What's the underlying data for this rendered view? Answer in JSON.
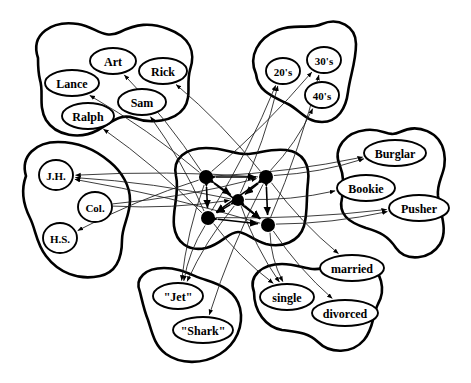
{
  "figure": {
    "type": "semantic-network-diagram",
    "width": 471,
    "height": 383,
    "background_color": "#ffffff",
    "outline_color": "#000000",
    "link_color": "#1a1a1a",
    "instance_node_color": "#000000"
  },
  "clusters": [
    {
      "id": "names",
      "name": "name-cluster",
      "outline": "M 38,58 C 30,34 52,20 78,24 C 96,27 104,40 120,32 C 136,24 150,22 168,29 C 190,37 196,52 190,70 C 186,84 192,96 184,108 C 174,122 150,124 134,118 C 120,113 112,122 98,130 C 80,140 56,136 46,120 C 38,106 44,92 40,80 C 38,72 38,65 38,58 Z",
      "units": [
        {
          "id": "art",
          "label": "Art",
          "cx": 113,
          "cy": 61,
          "rx": 23,
          "ry": 13,
          "font_size": 12
        },
        {
          "id": "rick",
          "label": "Rick",
          "cx": 163,
          "cy": 71,
          "rx": 24,
          "ry": 13,
          "font_size": 12
        },
        {
          "id": "lance",
          "label": "Lance",
          "cx": 72,
          "cy": 83,
          "rx": 27,
          "ry": 13,
          "font_size": 12
        },
        {
          "id": "sam",
          "label": "Sam",
          "cx": 142,
          "cy": 102,
          "rx": 24,
          "ry": 13,
          "font_size": 12
        },
        {
          "id": "ralph",
          "label": "Ralph",
          "cx": 88,
          "cy": 116,
          "rx": 26,
          "ry": 13,
          "font_size": 12
        }
      ]
    },
    {
      "id": "age",
      "name": "age-cluster",
      "outline": "M 256,74 C 248,56 258,38 278,30 C 296,23 310,30 322,24 C 338,17 356,26 356,44 C 356,62 350,76 348,92 C 346,108 338,122 322,122 C 306,122 300,110 288,104 C 274,97 258,92 256,74 Z",
      "units": [
        {
          "id": "twenties",
          "label": "20's",
          "cx": 283,
          "cy": 71,
          "rx": 17,
          "ry": 13,
          "font_size": 11
        },
        {
          "id": "thirties",
          "label": "30's",
          "cx": 324,
          "cy": 60,
          "rx": 17,
          "ry": 13,
          "font_size": 11
        },
        {
          "id": "forties",
          "label": "40's",
          "cx": 322,
          "cy": 95,
          "rx": 17,
          "ry": 13,
          "font_size": 11
        }
      ]
    },
    {
      "id": "occupation",
      "name": "occupation-cluster",
      "outline": "M 340,166 C 332,148 346,132 366,130 C 384,128 388,138 400,132 C 418,123 440,132 444,152 C 448,172 436,180 438,196 C 441,216 448,230 440,244 C 430,260 406,262 396,248 C 388,236 380,232 366,228 C 348,222 338,214 342,198 C 344,186 344,176 340,166 Z",
      "units": [
        {
          "id": "burglar",
          "label": "Burglar",
          "cx": 395,
          "cy": 153,
          "rx": 31,
          "ry": 13,
          "font_size": 12
        },
        {
          "id": "bookie",
          "label": "Bookie",
          "cx": 366,
          "cy": 188,
          "rx": 29,
          "ry": 13,
          "font_size": 12
        },
        {
          "id": "pusher",
          "label": "Pusher",
          "cx": 419,
          "cy": 208,
          "rx": 30,
          "ry": 13,
          "font_size": 12
        }
      ]
    },
    {
      "id": "education",
      "name": "education-cluster",
      "outline": "M 26,176 C 20,156 36,142 58,142 C 80,142 96,150 110,162 C 122,172 130,186 130,200 C 130,216 122,226 122,240 C 122,256 118,272 100,276 C 78,281 58,272 46,256 C 36,243 36,230 30,218 C 24,206 20,192 26,176 Z",
      "units": [
        {
          "id": "jh",
          "label": "J.H.",
          "cx": 56,
          "cy": 175,
          "rx": 17,
          "ry": 15,
          "font_size": 11
        },
        {
          "id": "col",
          "label": "Col.",
          "cx": 95,
          "cy": 207,
          "rx": 17,
          "ry": 15,
          "font_size": 11
        },
        {
          "id": "hs",
          "label": "H.S.",
          "cx": 60,
          "cy": 238,
          "rx": 17,
          "ry": 15,
          "font_size": 11
        }
      ]
    },
    {
      "id": "gang",
      "name": "gang-cluster",
      "outline": "M 140,292 C 134,278 146,268 164,268 C 182,268 192,276 206,280 C 222,285 236,292 240,308 C 244,326 236,344 220,354 C 202,365 180,364 166,354 C 154,345 152,332 148,320 C 144,310 142,300 140,292 Z",
      "units": [
        {
          "id": "jets",
          "label": "\"Jet\"",
          "cx": 178,
          "cy": 296,
          "rx": 25,
          "ry": 13,
          "font_size": 12
        },
        {
          "id": "sharks",
          "label": "\"Shark\"",
          "cx": 203,
          "cy": 330,
          "rx": 30,
          "ry": 13,
          "font_size": 12
        }
      ]
    },
    {
      "id": "marital",
      "name": "marital-status-cluster",
      "outline": "M 254,292 C 248,276 262,264 282,264 C 300,264 310,272 322,268 C 336,263 352,254 366,262 C 382,271 386,290 378,304 C 372,316 374,328 364,340 C 352,354 330,354 318,342 C 308,332 296,332 282,330 C 266,327 254,312 254,292 Z",
      "units": [
        {
          "id": "married",
          "label": "married",
          "cx": 352,
          "cy": 268,
          "rx": 32,
          "ry": 13,
          "font_size": 12
        },
        {
          "id": "single",
          "label": "single",
          "cx": 287,
          "cy": 297,
          "rx": 27,
          "ry": 13,
          "font_size": 12
        },
        {
          "id": "divorced",
          "label": "divorced",
          "cx": 345,
          "cy": 313,
          "rx": 33,
          "ry": 13,
          "font_size": 12
        }
      ]
    },
    {
      "id": "instances",
      "name": "instance-cluster",
      "outline": "M 176,176 C 172,158 186,148 206,148 C 224,148 234,154 246,154 C 258,154 270,148 286,150 C 304,152 310,166 308,182 C 306,198 308,212 304,226 C 299,242 282,248 266,244 C 252,240 246,232 238,232 C 228,232 222,244 206,248 C 188,252 176,242 174,226 C 172,210 180,192 176,176 Z",
      "units": [
        {
          "id": "inst1",
          "label": "",
          "cx": 206,
          "cy": 177,
          "r": 7
        },
        {
          "id": "inst2",
          "label": "",
          "cx": 266,
          "cy": 177,
          "r": 7
        },
        {
          "id": "inst3",
          "label": "",
          "cx": 238,
          "cy": 200,
          "r": 6
        },
        {
          "id": "inst4",
          "label": "",
          "cx": 208,
          "cy": 218,
          "r": 7
        },
        {
          "id": "inst5",
          "label": "",
          "cx": 268,
          "cy": 225,
          "r": 7
        }
      ]
    }
  ],
  "links": [
    {
      "from": "inst1",
      "to": "art"
    },
    {
      "from": "inst2",
      "to": "rick"
    },
    {
      "from": "inst1",
      "to": "lance"
    },
    {
      "from": "inst4",
      "to": "sam"
    },
    {
      "from": "inst4",
      "to": "ralph"
    },
    {
      "from": "inst3",
      "to": "twenties"
    },
    {
      "from": "inst4",
      "to": "twenties"
    },
    {
      "from": "inst1",
      "to": "thirties"
    },
    {
      "from": "inst5",
      "to": "thirties"
    },
    {
      "from": "inst2",
      "to": "forties"
    },
    {
      "from": "inst2",
      "to": "burglar"
    },
    {
      "from": "inst1",
      "to": "burglar"
    },
    {
      "from": "inst3",
      "to": "bookie"
    },
    {
      "from": "inst5",
      "to": "pusher"
    },
    {
      "from": "inst4",
      "to": "pusher"
    },
    {
      "from": "inst2",
      "to": "jh"
    },
    {
      "from": "inst3",
      "to": "jh"
    },
    {
      "from": "inst5",
      "to": "jh"
    },
    {
      "from": "inst1",
      "to": "hs"
    },
    {
      "from": "col",
      "to": "inst2"
    },
    {
      "from": "col",
      "to": "inst3"
    },
    {
      "from": "inst1",
      "to": "jets"
    },
    {
      "from": "inst3",
      "to": "jets"
    },
    {
      "from": "inst4",
      "to": "jets"
    },
    {
      "from": "inst2",
      "to": "sharks"
    },
    {
      "from": "inst3",
      "to": "single"
    },
    {
      "from": "inst4",
      "to": "single"
    },
    {
      "from": "inst5",
      "to": "single"
    },
    {
      "from": "inst2",
      "to": "married"
    },
    {
      "from": "inst5",
      "to": "divorced"
    }
  ],
  "inner_links": [
    {
      "from": "inst1",
      "to": "inst2"
    },
    {
      "from": "inst1",
      "to": "inst3"
    },
    {
      "from": "inst1",
      "to": "inst4"
    },
    {
      "from": "inst1",
      "to": "inst5"
    },
    {
      "from": "inst2",
      "to": "inst3"
    },
    {
      "from": "inst2",
      "to": "inst4"
    },
    {
      "from": "inst2",
      "to": "inst5"
    },
    {
      "from": "inst3",
      "to": "inst4"
    },
    {
      "from": "inst3",
      "to": "inst5"
    },
    {
      "from": "inst4",
      "to": "inst5"
    }
  ]
}
